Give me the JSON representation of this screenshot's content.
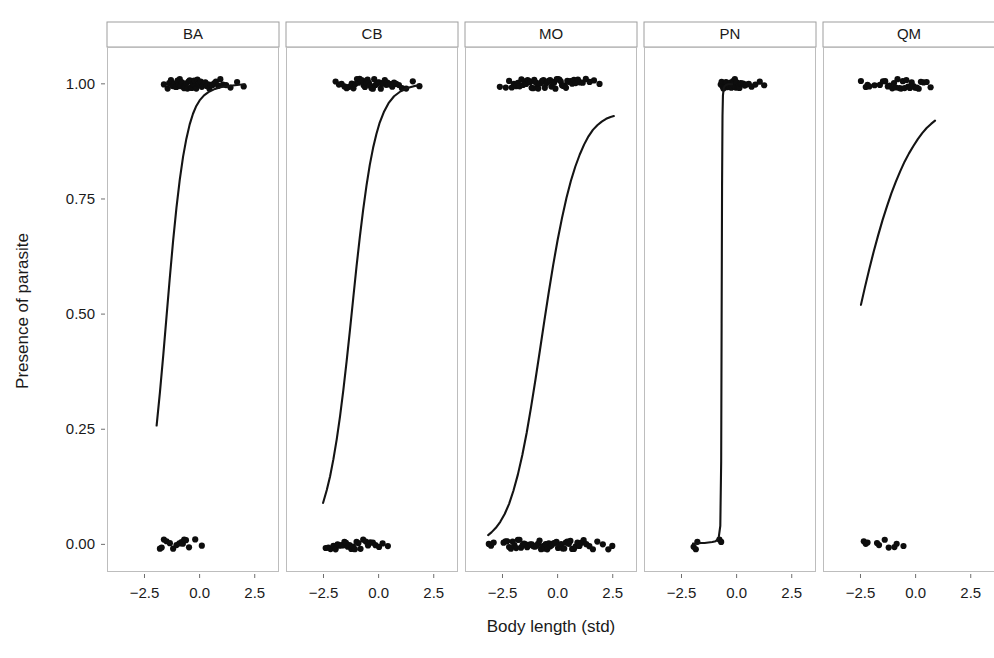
{
  "chart_data": {
    "type": "scatter",
    "title": "",
    "subtitle": "",
    "xlabel": "Body length (std)",
    "ylabel": "Presence of parasite",
    "xlim": [
      -4.2,
      3.6
    ],
    "ylim": [
      -0.06,
      1.08
    ],
    "xticks": [
      -2.5,
      0.0,
      2.5
    ],
    "xtick_labels": [
      "−2.5",
      "0.0",
      "2.5"
    ],
    "yticks": [
      0.0,
      0.25,
      0.5,
      0.75,
      1.0
    ],
    "ytick_labels": [
      "0.00",
      "0.25",
      "0.50",
      "0.75",
      "1.00"
    ],
    "grid": false,
    "legend": "none",
    "facet_variable": "species",
    "facets": [
      "BA",
      "CB",
      "MO",
      "PN",
      "QM"
    ],
    "marker_color": "#0d0d0d",
    "line_color": "#141414",
    "panel_border_color": "#bdbdbd",
    "strip_border_color": "#9e9e9e",
    "background_color": "#ffffff",
    "series": [
      {
        "name": "BA",
        "curve": [
          [
            -1.95,
            0.258
          ],
          [
            -1.8,
            0.33
          ],
          [
            -1.65,
            0.41
          ],
          [
            -1.5,
            0.495
          ],
          [
            -1.35,
            0.58
          ],
          [
            -1.2,
            0.66
          ],
          [
            -1.05,
            0.731
          ],
          [
            -0.9,
            0.792
          ],
          [
            -0.75,
            0.842
          ],
          [
            -0.6,
            0.881
          ],
          [
            -0.45,
            0.912
          ],
          [
            -0.3,
            0.935
          ],
          [
            -0.15,
            0.952
          ],
          [
            0.0,
            0.964
          ],
          [
            0.2,
            0.975
          ],
          [
            0.4,
            0.982
          ],
          [
            0.7,
            0.989
          ],
          [
            1.0,
            0.993
          ],
          [
            1.4,
            0.996
          ],
          [
            1.8,
            0.998
          ],
          [
            2.05,
            0.999
          ]
        ],
        "points_y1": [
          -1.62,
          -1.45,
          -1.38,
          -1.3,
          -1.22,
          -1.15,
          -1.1,
          -1.05,
          -1.0,
          -0.95,
          -0.9,
          -0.85,
          -0.8,
          -0.74,
          -0.7,
          -0.66,
          -0.6,
          -0.55,
          -0.5,
          -0.45,
          -0.4,
          -0.35,
          -0.3,
          -0.25,
          -0.2,
          -0.15,
          -0.1,
          -0.05,
          0.0,
          0.05,
          0.1,
          0.15,
          0.2,
          0.26,
          0.32,
          0.38,
          0.44,
          0.5,
          0.58,
          0.66,
          0.74,
          0.84,
          0.94,
          1.06,
          1.2,
          1.4,
          1.7,
          2.0
        ],
        "points_y0": [
          -1.8,
          -1.72,
          -1.62,
          -1.5,
          -1.35,
          -1.2,
          -1.05,
          -0.92,
          -0.82,
          -0.76,
          -0.7,
          -0.62,
          -0.48,
          -0.2,
          0.1
        ]
      },
      {
        "name": "CB",
        "curve": [
          [
            -2.52,
            0.09
          ],
          [
            -2.35,
            0.118
          ],
          [
            -2.2,
            0.148
          ],
          [
            -2.05,
            0.185
          ],
          [
            -1.9,
            0.228
          ],
          [
            -1.75,
            0.278
          ],
          [
            -1.6,
            0.335
          ],
          [
            -1.45,
            0.398
          ],
          [
            -1.3,
            0.465
          ],
          [
            -1.15,
            0.535
          ],
          [
            -1.0,
            0.604
          ],
          [
            -0.85,
            0.668
          ],
          [
            -0.7,
            0.727
          ],
          [
            -0.55,
            0.779
          ],
          [
            -0.4,
            0.824
          ],
          [
            -0.25,
            0.861
          ],
          [
            -0.1,
            0.891
          ],
          [
            0.05,
            0.916
          ],
          [
            0.25,
            0.94
          ],
          [
            0.45,
            0.958
          ],
          [
            0.7,
            0.973
          ],
          [
            1.0,
            0.984
          ],
          [
            1.3,
            0.991
          ],
          [
            1.6,
            0.995
          ],
          [
            1.82,
            0.997
          ]
        ],
        "points_y1": [
          -1.95,
          -1.8,
          -1.68,
          -1.55,
          -1.45,
          -1.38,
          -1.3,
          -1.22,
          -1.14,
          -1.06,
          -0.98,
          -0.92,
          -0.86,
          -0.8,
          -0.74,
          -0.68,
          -0.62,
          -0.56,
          -0.5,
          -0.44,
          -0.38,
          -0.32,
          -0.26,
          -0.2,
          -0.14,
          -0.08,
          -0.02,
          0.04,
          0.1,
          0.16,
          0.22,
          0.28,
          0.34,
          0.4,
          0.46,
          0.54,
          0.62,
          0.7,
          0.8,
          0.92,
          1.06,
          1.25,
          1.55,
          1.85
        ],
        "points_y0": [
          -2.4,
          -2.28,
          -2.18,
          -2.05,
          -1.95,
          -1.86,
          -1.78,
          -1.7,
          -1.62,
          -1.55,
          -1.48,
          -1.4,
          -1.32,
          -1.24,
          -1.16,
          -1.08,
          -1.0,
          -0.92,
          -0.82,
          -0.7,
          -0.58,
          -0.48,
          -0.38,
          -0.26,
          -0.14,
          0.02,
          0.18,
          0.42
        ]
      },
      {
        "name": "MO",
        "curve": [
          [
            -3.15,
            0.02
          ],
          [
            -3.0,
            0.026
          ],
          [
            -2.8,
            0.036
          ],
          [
            -2.6,
            0.049
          ],
          [
            -2.4,
            0.066
          ],
          [
            -2.2,
            0.088
          ],
          [
            -2.0,
            0.117
          ],
          [
            -1.8,
            0.152
          ],
          [
            -1.6,
            0.194
          ],
          [
            -1.4,
            0.243
          ],
          [
            -1.2,
            0.299
          ],
          [
            -1.0,
            0.359
          ],
          [
            -0.8,
            0.422
          ],
          [
            -0.6,
            0.486
          ],
          [
            -0.4,
            0.548
          ],
          [
            -0.2,
            0.607
          ],
          [
            0.0,
            0.661
          ],
          [
            0.2,
            0.709
          ],
          [
            0.4,
            0.752
          ],
          [
            0.6,
            0.789
          ],
          [
            0.8,
            0.82
          ],
          [
            1.0,
            0.846
          ],
          [
            1.2,
            0.868
          ],
          [
            1.4,
            0.886
          ],
          [
            1.6,
            0.9
          ],
          [
            1.8,
            0.91
          ],
          [
            2.0,
            0.918
          ],
          [
            2.2,
            0.924
          ],
          [
            2.4,
            0.928
          ],
          [
            2.55,
            0.93
          ]
        ],
        "points_y1": [
          -2.62,
          -2.35,
          -2.2,
          -2.08,
          -1.98,
          -1.88,
          -1.8,
          -1.72,
          -1.64,
          -1.57,
          -1.5,
          -1.43,
          -1.36,
          -1.3,
          -1.24,
          -1.18,
          -1.12,
          -1.06,
          -1.0,
          -0.94,
          -0.88,
          -0.82,
          -0.76,
          -0.7,
          -0.64,
          -0.58,
          -0.52,
          -0.46,
          -0.4,
          -0.34,
          -0.28,
          -0.22,
          -0.16,
          -0.1,
          -0.04,
          0.02,
          0.08,
          0.14,
          0.2,
          0.26,
          0.32,
          0.38,
          0.44,
          0.5,
          0.58,
          0.66,
          0.74,
          0.82,
          0.92,
          1.02,
          1.14,
          1.28,
          1.45,
          1.65,
          1.9
        ],
        "points_y0": [
          -3.12,
          -3.02,
          -2.9,
          -2.45,
          -2.36,
          -2.28,
          -2.2,
          -2.12,
          -2.04,
          -1.96,
          -1.88,
          -1.8,
          -1.73,
          -1.66,
          -1.59,
          -1.52,
          -1.45,
          -1.38,
          -1.31,
          -1.24,
          -1.17,
          -1.1,
          -1.03,
          -0.96,
          -0.89,
          -0.82,
          -0.75,
          -0.68,
          -0.61,
          -0.54,
          -0.47,
          -0.4,
          -0.33,
          -0.26,
          -0.19,
          -0.12,
          -0.05,
          0.02,
          0.09,
          0.16,
          0.23,
          0.3,
          0.37,
          0.44,
          0.51,
          0.58,
          0.66,
          0.74,
          0.82,
          0.9,
          0.99,
          1.08,
          1.18,
          1.3,
          1.44,
          1.6,
          1.8,
          2.05,
          2.3,
          2.48
        ]
      },
      {
        "name": "PN",
        "curve": [
          [
            -1.98,
            0.002
          ],
          [
            -1.8,
            0.002
          ],
          [
            -1.62,
            0.003
          ],
          [
            -1.45,
            0.003
          ],
          [
            -1.28,
            0.004
          ],
          [
            -1.1,
            0.005
          ],
          [
            -0.95,
            0.007
          ],
          [
            -0.82,
            0.012
          ],
          [
            -0.74,
            0.04
          ],
          [
            -0.7,
            0.18
          ],
          [
            -0.68,
            0.48
          ],
          [
            -0.66,
            0.78
          ],
          [
            -0.64,
            0.93
          ],
          [
            -0.62,
            0.975
          ],
          [
            -0.58,
            0.992
          ],
          [
            -0.5,
            0.997
          ],
          [
            -0.4,
            0.999
          ],
          [
            -0.2,
            0.999
          ]
        ],
        "points_y1": [
          -0.72,
          -0.68,
          -0.64,
          -0.6,
          -0.56,
          -0.52,
          -0.48,
          -0.44,
          -0.4,
          -0.36,
          -0.32,
          -0.28,
          -0.24,
          -0.2,
          -0.16,
          -0.12,
          -0.08,
          -0.04,
          0.0,
          0.04,
          0.08,
          0.13,
          0.18,
          0.24,
          0.3,
          0.37,
          0.45,
          0.55,
          0.68,
          0.85,
          1.05,
          1.25
        ],
        "points_y0": [
          -1.95,
          -1.85,
          -1.78,
          -0.78,
          -0.7
        ]
      },
      {
        "name": "QM",
        "curve": [
          [
            -2.48,
            0.52
          ],
          [
            -2.3,
            0.558
          ],
          [
            -2.1,
            0.598
          ],
          [
            -1.9,
            0.636
          ],
          [
            -1.7,
            0.671
          ],
          [
            -1.5,
            0.704
          ],
          [
            -1.3,
            0.734
          ],
          [
            -1.1,
            0.762
          ],
          [
            -0.9,
            0.787
          ],
          [
            -0.7,
            0.81
          ],
          [
            -0.5,
            0.831
          ],
          [
            -0.3,
            0.849
          ],
          [
            -0.1,
            0.865
          ],
          [
            0.1,
            0.88
          ],
          [
            0.3,
            0.893
          ],
          [
            0.5,
            0.904
          ],
          [
            0.7,
            0.913
          ],
          [
            0.88,
            0.92
          ]
        ],
        "points_y1": [
          -2.48,
          -2.26,
          -2.18,
          -2.1,
          -1.86,
          -1.62,
          -1.48,
          -1.38,
          -1.26,
          -1.18,
          -1.06,
          -0.98,
          -0.9,
          -0.82,
          -0.74,
          -0.66,
          -0.58,
          -0.5,
          -0.42,
          -0.34,
          -0.26,
          -0.18,
          -0.1,
          -0.02,
          0.06,
          0.14,
          0.24,
          0.36,
          0.5,
          0.68
        ],
        "points_y0": [
          -2.35,
          -2.26,
          -2.18,
          -1.75,
          -1.66,
          -1.4,
          -1.22,
          -0.96,
          -0.86,
          -0.55
        ]
      }
    ]
  }
}
